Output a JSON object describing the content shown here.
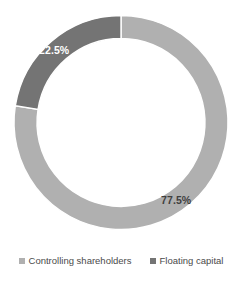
{
  "chart_data": {
    "type": "pie",
    "variant": "donut",
    "title": "",
    "xlabel": "",
    "ylabel": "",
    "categories": [
      "Controlling shareholders",
      "Floating capital"
    ],
    "values": [
      77.5,
      22.5
    ],
    "value_unit": "%",
    "data_labels": [
      "77.5%",
      "22.5%"
    ],
    "colors": [
      "#b0b0b0",
      "#747474"
    ],
    "start_angle_deg": 0,
    "direction": "clockwise",
    "inner_radius_ratio": 0.785,
    "grid": false,
    "legend_position": "bottom",
    "background": "#ffffff",
    "slices": [
      {
        "name": "Controlling shareholders",
        "value": 77.5,
        "label": "77.5%",
        "color": "#b0b0b0",
        "label_color": "#3f3f3f"
      },
      {
        "name": "Floating capital",
        "value": 22.5,
        "label": "22.5%",
        "color": "#747474",
        "label_color": "#ffffff"
      }
    ]
  },
  "legend": {
    "items": [
      {
        "label": "Controlling shareholders",
        "color": "#b0b0b0"
      },
      {
        "label": "Floating capital",
        "color": "#747474"
      }
    ]
  }
}
